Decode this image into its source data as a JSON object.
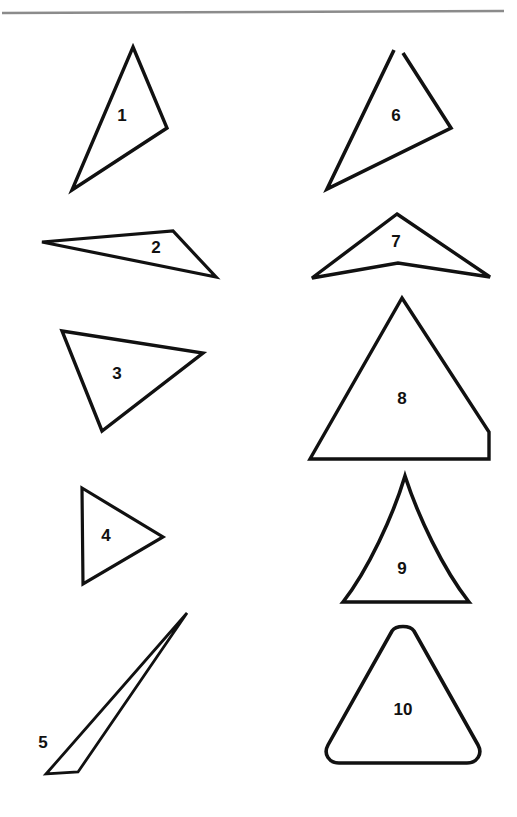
{
  "page": {
    "width": 517,
    "height": 817,
    "background_color": "#ffffff",
    "ink_color": "#111111",
    "rule_color": "#8b8b8b"
  },
  "top_rule": {
    "name": "horizontal-rule",
    "x1": 2,
    "y1": 13,
    "x2": 504,
    "y2": 11,
    "color": "#8b8b8b",
    "thickness": 2.6
  },
  "figures": [
    {
      "id": 1,
      "label": "1",
      "kind": "triangle",
      "column": "left",
      "row": 1,
      "stroke_width": 3.4,
      "label_x": 122,
      "label_y": 117,
      "points": "133,47 167,128 72,190"
    },
    {
      "id": 2,
      "label": "2",
      "kind": "triangle",
      "column": "left",
      "row": 2,
      "stroke_width": 3.2,
      "label_x": 156,
      "label_y": 249,
      "points": "42,242 173,231 216,277"
    },
    {
      "id": 3,
      "label": "3",
      "kind": "triangle",
      "column": "left",
      "row": 3,
      "stroke_width": 3.4,
      "label_x": 117,
      "label_y": 375,
      "points": "62,331 203,353 102,431"
    },
    {
      "id": 4,
      "label": "4",
      "kind": "triangle",
      "column": "left",
      "row": 4,
      "stroke_width": 3.2,
      "label_x": 106,
      "label_y": 537,
      "points": "82,488 163,537 83,584"
    },
    {
      "id": 5,
      "label": "5",
      "kind": "triangle",
      "column": "left",
      "row": 5,
      "stroke_width": 2.8,
      "label_x": 43,
      "label_y": 744,
      "points": "187,613 78,772 46,774"
    },
    {
      "id": 6,
      "label": "6",
      "kind": "triangle-open-vertex",
      "column": "right",
      "row": 1,
      "stroke_width": 3.6,
      "label_x": 396,
      "label_y": 117,
      "points": "398,47 451,128 327,189",
      "note": "top vertex is drawn open, the two upper edges do not meet"
    },
    {
      "id": 7,
      "label": "7",
      "kind": "concave-quadrilateral",
      "column": "right",
      "row": 2,
      "stroke_width": 3.4,
      "label_x": 396,
      "label_y": 243,
      "points": "397,214 490,277 398,263 312,278"
    },
    {
      "id": 8,
      "label": "8",
      "kind": "quadrilateral-cut-corner",
      "column": "right",
      "row": 3,
      "stroke_width": 3.4,
      "label_x": 402,
      "label_y": 400,
      "points": "402,298 489,432 489,459 310,459"
    },
    {
      "id": 9,
      "label": "9",
      "kind": "curved-sided-triangle",
      "column": "right",
      "row": 4,
      "stroke_width": 3.6,
      "label_x": 402,
      "label_y": 570,
      "path": "M405,476 C393,516 368,570 343,602 L469,602 C443,569 418,516 405,476 Z",
      "note": "sides bow inward, concave"
    },
    {
      "id": 10,
      "label": "10",
      "kind": "rounded-triangle",
      "column": "right",
      "row": 5,
      "stroke_width": 3.6,
      "label_x": 403,
      "label_y": 711,
      "path": "M392,631 C396,625 410,625 414,631 L478,745 C483,754 477,763 467,763 L339,763 C329,763 323,754 328,745 Z",
      "note": "triangle with strongly rounded corners"
    }
  ]
}
